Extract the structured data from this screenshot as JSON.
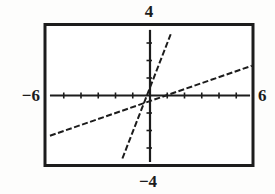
{
  "chart_data": {
    "type": "line",
    "title": "",
    "window": {
      "xmin": -6,
      "xmax": 6,
      "ymin": -4,
      "ymax": 4,
      "xscl": 1,
      "yscl": 1
    },
    "axis_labels": {
      "top": "4",
      "bottom": "−4",
      "left": "−6",
      "right": "6"
    },
    "series": [
      {
        "name": "steep-line",
        "approx_equation": "y ≈ 2.6x + 0.5",
        "points": [
          [
            -1.6,
            -3.6
          ],
          [
            1.2,
            3.5
          ]
        ]
      },
      {
        "name": "shallow-line",
        "approx_equation": "y ≈ x/3 − 1/3",
        "points": [
          [
            -5.8,
            -2.3
          ],
          [
            5.9,
            1.7
          ]
        ]
      }
    ],
    "x_ticks": [
      -5,
      -4,
      -3,
      -2,
      -1,
      1,
      2,
      3,
      4,
      5
    ],
    "y_ticks": [
      -3,
      -2,
      -1,
      1,
      2,
      3
    ],
    "grid": false,
    "legend": false,
    "ink_color": "#1c1c1c",
    "background_color": "#ffffff"
  }
}
